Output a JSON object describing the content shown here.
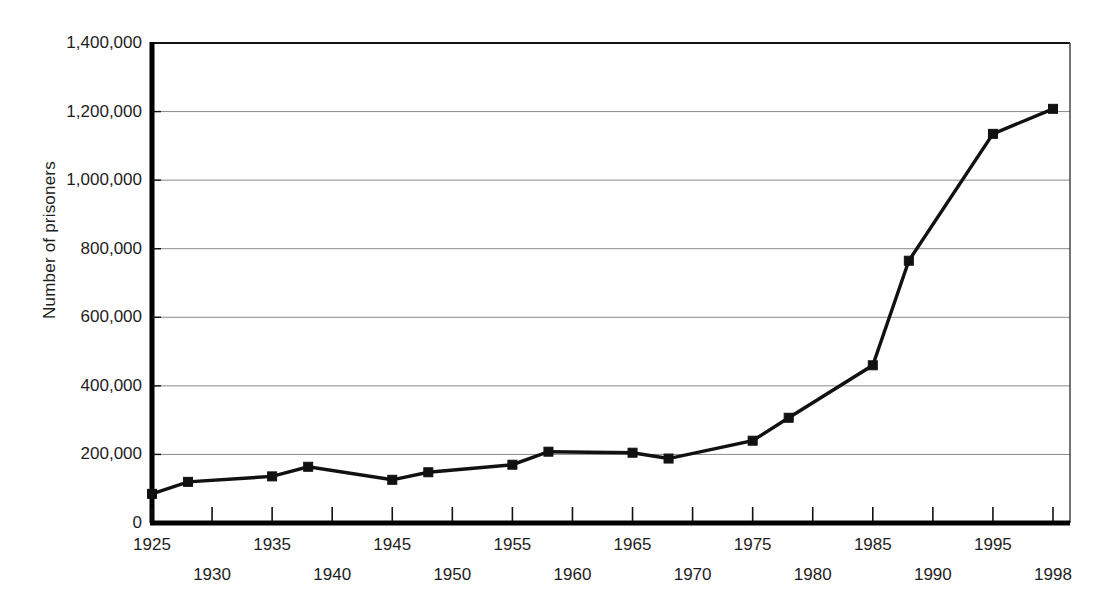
{
  "chart_data": {
    "type": "line",
    "title": "",
    "subtitle": "",
    "xlabel": "",
    "ylabel": "Number of prisoners",
    "xlim": [
      1925,
      1998
    ],
    "ylim": [
      0,
      1400000
    ],
    "grid": true,
    "legend": null,
    "marker": "square",
    "line_color": "#111111",
    "marker_color": "#111111",
    "grid_color": "#8a8a8a",
    "axis_color": "#000000",
    "background": "#ffffff",
    "y_ticks": [
      0,
      200000,
      400000,
      600000,
      800000,
      1000000,
      1200000,
      1400000
    ],
    "y_tick_labels": [
      "0",
      "200,000",
      "400,000",
      "600,000",
      "800,000",
      "1,000,000",
      "1,200,000",
      "1,400,000"
    ],
    "x_ticks": [
      1925,
      1930,
      1935,
      1940,
      1945,
      1950,
      1955,
      1960,
      1965,
      1970,
      1975,
      1980,
      1985,
      1990,
      1995,
      1998
    ],
    "x_tick_labels": [
      "1925",
      "1930",
      "1935",
      "1940",
      "1945",
      "1950",
      "1955",
      "1960",
      "1965",
      "1970",
      "1975",
      "1980",
      "1985",
      "1990",
      "1995",
      "1998"
    ],
    "x_tick_rows": [
      0,
      1,
      0,
      1,
      0,
      1,
      0,
      1,
      0,
      1,
      0,
      1,
      0,
      1,
      0,
      1
    ],
    "x": [
      1925,
      1928,
      1935,
      1938,
      1945,
      1948,
      1955,
      1958,
      1965,
      1968,
      1975,
      1978,
      1985,
      1988,
      1995,
      1998
    ],
    "values": [
      85000,
      120000,
      136000,
      164000,
      126000,
      148000,
      170000,
      208000,
      205000,
      188000,
      240000,
      307000,
      460000,
      765000,
      1135000,
      1208000
    ],
    "series": [
      {
        "name": "Number of prisoners",
        "x": [
          1925,
          1928,
          1935,
          1938,
          1945,
          1948,
          1955,
          1958,
          1965,
          1968,
          1975,
          1978,
          1985,
          1988,
          1995,
          1998
        ],
        "values": [
          85000,
          120000,
          136000,
          164000,
          126000,
          148000,
          170000,
          208000,
          205000,
          188000,
          240000,
          307000,
          460000,
          765000,
          1135000,
          1208000
        ]
      }
    ]
  }
}
